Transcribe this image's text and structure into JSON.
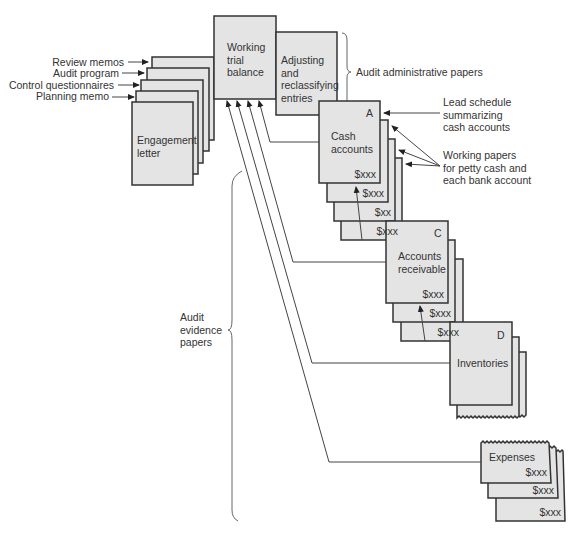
{
  "administrative": {
    "review_memos": "Review memos",
    "audit_program": "Audit program",
    "control_questionnaires": "Control questionnaires",
    "planning_memo": "Planning memo",
    "engagement_letter_1": "Engagement",
    "engagement_letter_2": "letter",
    "working_trial_balance_1": "Working",
    "working_trial_balance_2": "trial",
    "working_trial_balance_3": "balance",
    "adjusting_1": "Adjusting",
    "adjusting_2": "and",
    "adjusting_3": "reclassifying",
    "adjusting_4": "entries",
    "brace_label": "Audit administrative papers"
  },
  "cash": {
    "ref": "A",
    "title_1": "Cash",
    "title_2": "accounts",
    "amounts": [
      "$xxx",
      "$xxx",
      "$xx",
      "$xxx"
    ]
  },
  "receivables": {
    "ref": "C",
    "title_1": "Accounts",
    "title_2": "receivable",
    "amounts": [
      "$xxx",
      "$xxx",
      "$xxx"
    ]
  },
  "inventories": {
    "ref": "D",
    "title": "Inventories"
  },
  "expenses": {
    "title": "Expenses",
    "amounts": [
      "$xxx",
      "$xxx",
      "$xxx"
    ]
  },
  "annotations": {
    "lead_schedule_1": "Lead schedule",
    "lead_schedule_2": "summarizing",
    "lead_schedule_3": "cash accounts",
    "working_papers_1": "Working papers",
    "working_papers_2": "for petty cash and",
    "working_papers_3": "each bank account",
    "evidence_1": "Audit",
    "evidence_2": "evidence",
    "evidence_3": "papers"
  }
}
